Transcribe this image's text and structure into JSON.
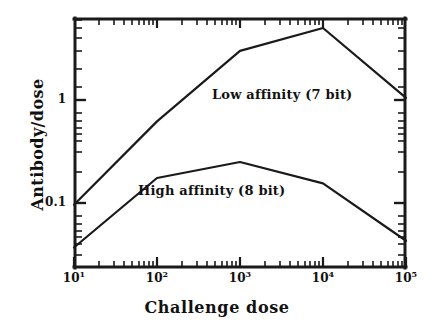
{
  "chart_data": {
    "type": "line",
    "title": "",
    "subtitle": "",
    "xlabel": "Challenge dose",
    "ylabel": "Antibody/dose",
    "xscale": "log",
    "yscale": "log",
    "xlim": [
      10,
      100000
    ],
    "ylim": [
      0.025,
      6.3
    ],
    "grid": false,
    "legend_position": "inline-annotation",
    "x": [
      10,
      100,
      1000,
      10000,
      100000
    ],
    "xtick_labels": [
      "10",
      "10",
      "10",
      "10",
      "10"
    ],
    "xtick_exponents": [
      "1",
      "2",
      "3",
      "4",
      "5"
    ],
    "ytick_labels": [
      "1",
      "0.1"
    ],
    "ytick_values": [
      1,
      0.1
    ],
    "series": [
      {
        "name": "Low affinity (7 bit)",
        "values": [
          0.096,
          0.62,
          3.0,
          5.0,
          1.05
        ]
      },
      {
        "name": "High affinity (8 bit)",
        "values": [
          0.037,
          0.175,
          0.25,
          0.155,
          0.043
        ]
      }
    ],
    "annotations": [
      {
        "text": "Low affinity (7 bit)",
        "x_px": 212,
        "y_px": 87
      },
      {
        "text": "High affinity (8 bit)",
        "x_px": 138,
        "y_px": 183
      }
    ],
    "colors": {
      "line": "#1a1a1a",
      "axis": "#1a1a1a",
      "background": "#ffffff",
      "text": "#111111"
    }
  },
  "axes": {
    "x_title": "Challenge dose",
    "y_title": "Antibody/dose"
  }
}
